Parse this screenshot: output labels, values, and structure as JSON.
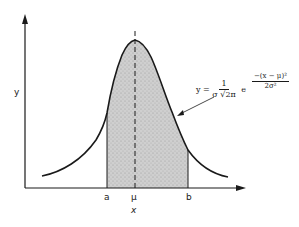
{
  "figure": {
    "axes": {
      "y_label": "y",
      "x_label": "x"
    },
    "markers": {
      "a": "a",
      "mu": "μ",
      "b": "b"
    },
    "formula": {
      "lhs": "y =",
      "coef_num": "1",
      "coef_den": "σ √2π",
      "base": "e",
      "exp_num": "−(x − μ)²",
      "exp_den": "2σ²"
    },
    "colors": {
      "ink": "#1a1a1a",
      "shade": "#c9c9c9",
      "background": "#ffffff"
    }
  }
}
